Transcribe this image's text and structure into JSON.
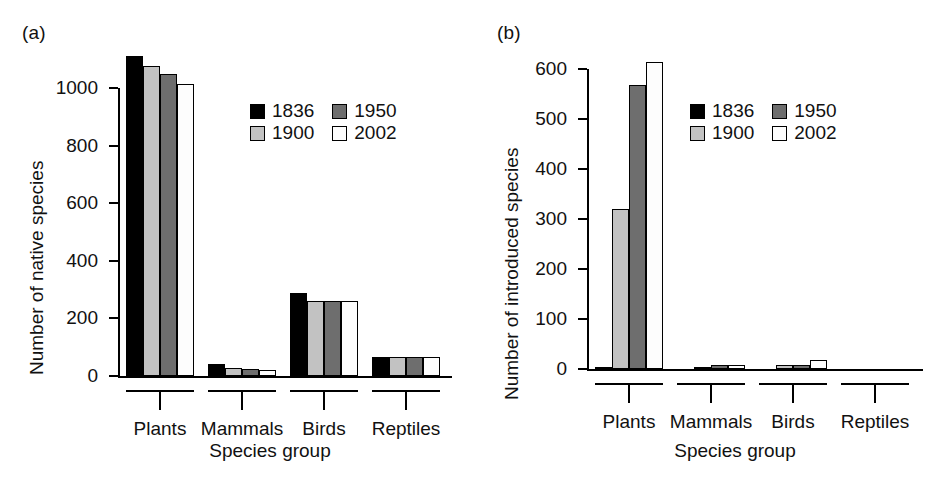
{
  "figure": {
    "background": "#ffffff",
    "panels": [
      {
        "tag": "(a)",
        "ylabel": "Number of native species",
        "xlabel": "Species group"
      },
      {
        "tag": "(b)",
        "ylabel": "Number of introduced species",
        "xlabel": "Species group"
      }
    ]
  },
  "legend": {
    "title": "",
    "position": "upper-right inside plot",
    "entries": [
      {
        "label": "1836",
        "color": "#000000"
      },
      {
        "label": "1950",
        "color": "#6e6e6e"
      },
      {
        "label": "1900",
        "color": "#c2c2c2"
      },
      {
        "label": "2002",
        "color": "#fdfdfd"
      }
    ]
  },
  "chart_data": [
    {
      "type": "bar",
      "panel": "(a)",
      "title": "",
      "xlabel": "Species group",
      "ylabel": "Number of native species",
      "categories": [
        "Plants",
        "Mammals",
        "Birds",
        "Reptiles"
      ],
      "ylim": [
        0,
        1150
      ],
      "yticks": [
        0,
        200,
        400,
        600,
        800,
        1000
      ],
      "ytick_labels": [
        "0",
        "200",
        "400",
        "600",
        "800",
        "1000"
      ],
      "grid": false,
      "legend_position": "upper right",
      "series": [
        {
          "name": "1836",
          "color": "#000000",
          "values": [
            1111,
            41,
            288,
            66
          ]
        },
        {
          "name": "1900",
          "color": "#c2c2c2",
          "values": [
            1076,
            28,
            260,
            66
          ]
        },
        {
          "name": "1950",
          "color": "#6e6e6e",
          "values": [
            1049,
            24,
            261,
            66
          ]
        },
        {
          "name": "2002",
          "color": "#fdfdfd",
          "values": [
            1014,
            20,
            261,
            65
          ]
        }
      ]
    },
    {
      "type": "bar",
      "panel": "(b)",
      "title": "",
      "xlabel": "Species group",
      "ylabel": "Number of introduced species",
      "categories": [
        "Plants",
        "Mammals",
        "Birds",
        "Reptiles"
      ],
      "ylim": [
        0,
        630
      ],
      "yticks": [
        0,
        100,
        200,
        300,
        400,
        500,
        600
      ],
      "ytick_labels": [
        "0",
        "100",
        "200",
        "300",
        "400",
        "500",
        "600"
      ],
      "grid": false,
      "legend_position": "upper right",
      "series": [
        {
          "name": "1836",
          "color": "#000000",
          "values": [
            4,
            0,
            1,
            0
          ]
        },
        {
          "name": "1900",
          "color": "#c2c2c2",
          "values": [
            320,
            5,
            8,
            1
          ]
        },
        {
          "name": "1950",
          "color": "#6e6e6e",
          "values": [
            568,
            8,
            9,
            1
          ]
        },
        {
          "name": "2002",
          "color": "#fdfdfd",
          "values": [
            614,
            8,
            19,
            1
          ]
        }
      ]
    }
  ]
}
